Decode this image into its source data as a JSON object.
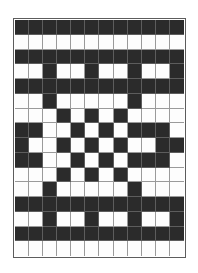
{
  "image": {
    "title": "Matrix Code Grid",
    "type": "binary-matrix",
    "width_px": 198,
    "height_px": 273
  },
  "grid": {
    "columns": 12,
    "rows": 16,
    "on_color": "#2b2b2b",
    "off_color": "#fdfdfd",
    "grid_line_color": "#9a9a9a",
    "border_color": "#5c5c5c",
    "legend": {
      "on": "dark module",
      "off": "light module"
    },
    "matrix": [
      [
        1,
        1,
        1,
        1,
        1,
        1,
        1,
        1,
        1,
        1,
        1,
        1
      ],
      [
        0,
        0,
        0,
        0,
        0,
        0,
        0,
        0,
        0,
        0,
        0,
        0
      ],
      [
        1,
        1,
        1,
        1,
        1,
        1,
        1,
        1,
        1,
        1,
        1,
        1
      ],
      [
        0,
        0,
        1,
        0,
        0,
        1,
        0,
        0,
        1,
        0,
        0,
        1
      ],
      [
        1,
        1,
        1,
        1,
        1,
        1,
        1,
        1,
        1,
        1,
        1,
        1
      ],
      [
        0,
        0,
        1,
        0,
        0,
        0,
        0,
        0,
        1,
        0,
        0,
        0
      ],
      [
        0,
        0,
        0,
        1,
        0,
        1,
        0,
        1,
        0,
        0,
        0,
        0
      ],
      [
        1,
        1,
        0,
        0,
        1,
        0,
        1,
        0,
        1,
        1,
        1,
        0
      ],
      [
        1,
        0,
        0,
        1,
        0,
        1,
        0,
        1,
        0,
        0,
        1,
        1
      ],
      [
        1,
        1,
        0,
        0,
        1,
        0,
        1,
        0,
        1,
        1,
        1,
        0
      ],
      [
        0,
        0,
        0,
        1,
        0,
        1,
        0,
        1,
        0,
        0,
        0,
        0
      ],
      [
        0,
        0,
        1,
        0,
        0,
        0,
        0,
        0,
        1,
        0,
        0,
        0
      ],
      [
        1,
        1,
        1,
        1,
        1,
        1,
        1,
        1,
        1,
        1,
        1,
        1
      ],
      [
        0,
        0,
        1,
        0,
        0,
        1,
        0,
        0,
        1,
        0,
        0,
        1
      ],
      [
        1,
        1,
        1,
        1,
        1,
        1,
        1,
        1,
        1,
        1,
        1,
        1
      ],
      [
        0,
        0,
        0,
        0,
        0,
        0,
        0,
        0,
        0,
        0,
        0,
        0
      ]
    ]
  }
}
